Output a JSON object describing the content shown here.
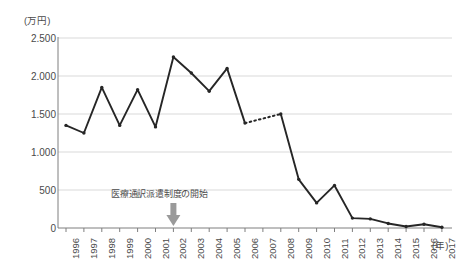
{
  "chart_data": {
    "type": "line",
    "title": "",
    "xlabel": "(年)",
    "ylabel": "(万円)",
    "x": [
      "1996",
      "1997",
      "1998",
      "1999",
      "2000",
      "2001",
      "2002",
      "2003",
      "2004",
      "2005",
      "2006",
      "2007",
      "2008",
      "2009",
      "2010",
      "2011",
      "2012",
      "2013",
      "2014",
      "2015",
      "2016",
      "2017"
    ],
    "categories": [
      "1996",
      "1997",
      "1998",
      "1999",
      "2000",
      "2001",
      "2002",
      "2003",
      "2004",
      "2005",
      "2006",
      "2007",
      "2008",
      "2009",
      "2010",
      "2011",
      "2012",
      "2013",
      "2014",
      "2015",
      "2016",
      "2017"
    ],
    "values": [
      1350,
      1250,
      1850,
      1350,
      1820,
      1330,
      2250,
      2040,
      1800,
      2100,
      1380,
      null,
      1500,
      640,
      330,
      560,
      130,
      120,
      60,
      20,
      50,
      10
    ],
    "series": [
      {
        "name": "金額",
        "values": [
          1350,
          1250,
          1850,
          1350,
          1820,
          1330,
          2250,
          2040,
          1800,
          2100,
          1380,
          null,
          1500,
          640,
          330,
          560,
          130,
          120,
          60,
          20,
          50,
          10
        ]
      }
    ],
    "gap_years": [
      "2007"
    ],
    "gap_style": "dotted",
    "ylim": [
      0,
      2500
    ],
    "ytick_values": [
      0,
      500,
      1000,
      1500,
      2000,
      2500
    ],
    "ytick_labels": [
      "0",
      "500",
      "1.000",
      "1.500",
      "2.000",
      "2.500"
    ],
    "grid": true,
    "grid_axis": "y",
    "legend": "none",
    "line_color": "#262626",
    "marker": "circle",
    "annotations": [
      {
        "text": "医療通訳派遣制度の開始",
        "arrow": "down-arrow",
        "points_to_x": "2002",
        "arrow_color": "#9a9a9a"
      }
    ]
  },
  "axes": {
    "y_unit_label": "(万円)",
    "x_unit_label": "(年)"
  },
  "colors": {
    "line": "#262626",
    "grid": "#d9d9d9",
    "axis": "#7f7f7f",
    "text": "#4a4a4a",
    "arrow": "#9a9a9a",
    "background": "#ffffff"
  }
}
